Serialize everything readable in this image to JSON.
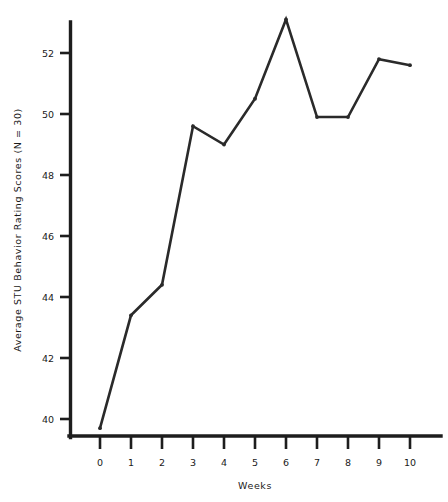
{
  "chart_data": {
    "type": "line",
    "title": "",
    "xlabel": "Weeks",
    "ylabel": "Average STU Behavior Rating Scores (N = 30)",
    "x": [
      0,
      1,
      2,
      3,
      4,
      5,
      6,
      7,
      8,
      9,
      10
    ],
    "values": [
      39.7,
      43.4,
      44.4,
      49.6,
      49.0,
      50.5,
      53.1,
      49.9,
      49.9,
      51.8,
      51.6
    ],
    "series": [
      {
        "name": "Average STU Behavior Rating Scores",
        "values": [
          39.7,
          43.4,
          44.4,
          49.6,
          49.0,
          50.5,
          53.1,
          49.9,
          49.9,
          51.8,
          51.6
        ]
      }
    ],
    "xticks": [
      "0",
      "1",
      "2",
      "3",
      "4",
      "5",
      "6",
      "7",
      "8",
      "9",
      "10"
    ],
    "yticks": [
      "40",
      "42",
      "44",
      "46",
      "48",
      "50",
      "52"
    ],
    "ytick_values": [
      40,
      42,
      44,
      46,
      48,
      50,
      52
    ],
    "xlim": [
      -0.45,
      11.1
    ],
    "ylim": [
      39.4,
      53.4
    ],
    "grid": false,
    "legend": false,
    "legend_position": "none",
    "line_color": "#2a2a2a",
    "axis_color": "#1d1d1d",
    "background": "#ffffff"
  }
}
